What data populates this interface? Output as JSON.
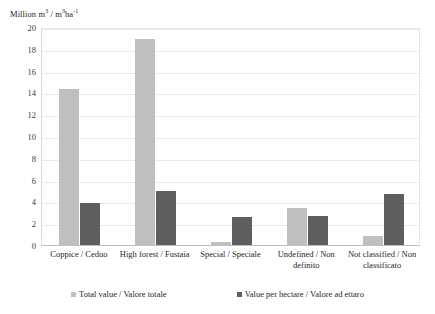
{
  "chart_data": {
    "type": "bar",
    "title": "",
    "subtitle": "",
    "ylabel": "Million m3 / m3ha-1",
    "ylabel_parts": {
      "prefix": "Million m",
      "sup1": "3",
      "mid": " / m",
      "sup2": "3",
      "unit": "ha",
      "sup3": "-1"
    },
    "xlabel": "",
    "ylim": [
      0,
      20
    ],
    "ytick_step": 2,
    "yticks": [
      "0",
      "2",
      "4",
      "6",
      "8",
      "10",
      "12",
      "14",
      "16",
      "18",
      "20"
    ],
    "grid": true,
    "legend_position": "bottom",
    "categories": [
      "Coppice / Ceduo",
      "High forest / Fustaia",
      "Special / Speciale",
      "Undefined / Non definito",
      "Not classified / Non classificato"
    ],
    "series": [
      {
        "name": "Total value / Valore totale",
        "color": "#bfbfbf",
        "values": [
          14.3,
          18.9,
          0.25,
          3.4,
          0.8
        ]
      },
      {
        "name": "Value per hectare / Valore ad ettaro",
        "color": "#5e5e5e",
        "values": [
          3.9,
          5.0,
          2.6,
          2.7,
          4.7
        ]
      }
    ]
  },
  "legend": {
    "items": [
      {
        "label": "Total value / Valore totale",
        "color": "#bfbfbf"
      },
      {
        "label": "Value per hectare / Valore ad ettaro",
        "color": "#5e5e5e"
      }
    ]
  }
}
